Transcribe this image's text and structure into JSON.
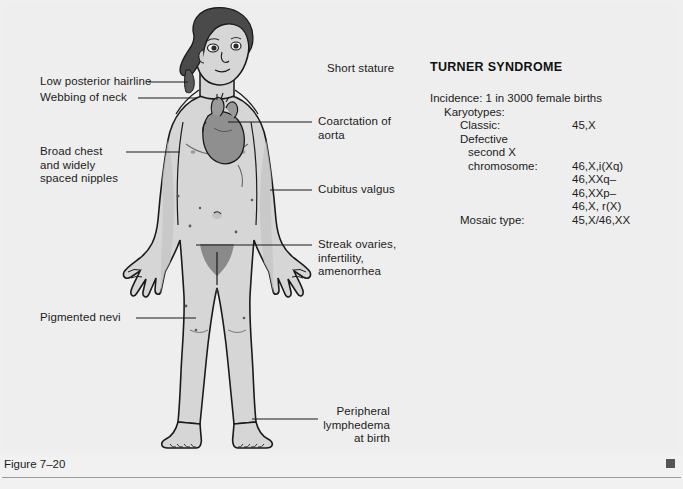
{
  "figure": {
    "caption": "Figure 7–20",
    "end_mark": "square-marker"
  },
  "panel": {
    "title": "TURNER SYNDROME",
    "incidence": "Incidence: 1 in 3000 female births",
    "karyotypes_heading": "Karyotypes:",
    "rows": [
      {
        "key": "Classic:",
        "value": "45,X",
        "indent": "i2"
      },
      {
        "key": "Defective",
        "value": "",
        "indent": "i2"
      },
      {
        "key": "second X",
        "value": "",
        "indent": "i3"
      },
      {
        "key": "chromosome:",
        "value": "46,X,i(Xq)",
        "indent": "i3"
      },
      {
        "key": "",
        "value": "46,XXq–",
        "indent": "i3"
      },
      {
        "key": "",
        "value": "46,XXp–",
        "indent": "i3"
      },
      {
        "key": "",
        "value": "46,X, r(X)",
        "indent": "i3"
      },
      {
        "key": "Mosaic type:",
        "value": "45,X/46,XX",
        "indent": "i2"
      }
    ]
  },
  "labels": {
    "low_posterior_hairline": "Low posterior hairline",
    "webbing_of_neck": "Webbing of neck",
    "broad_chest": "Broad chest\nand widely\nspaced nipples",
    "pigmented_nevi": "Pigmented nevi",
    "short_stature": "Short stature",
    "coarctation_of_aorta": "Coarctation of\naorta",
    "cubitus_valgus": "Cubitus valgus",
    "streak_ovaries": "Streak ovaries,\ninfertility,\namenorrhea",
    "peripheral_lymphedema": "Peripheral\nlymphedema\nat birth"
  },
  "colors": {
    "background": "#f1f1f1",
    "plate": "#eeeeee",
    "skin": "#d6d6d6",
    "skin_shadow": "#c2c2c2",
    "hair": "#4a4a4a",
    "heart": "#8f8f8f",
    "outline": "#1a1a1a",
    "rule": "#9a9a9a",
    "end_mark": "#555555"
  }
}
